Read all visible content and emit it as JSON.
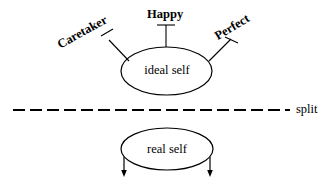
{
  "diagram": {
    "type": "concept-diagram",
    "background_color": "#ffffff",
    "stroke_color": "#000000",
    "nodes": [
      {
        "id": "ideal_self",
        "label": "ideal self",
        "shape": "ellipse"
      },
      {
        "id": "real_self",
        "label": "real self",
        "shape": "ellipse"
      }
    ],
    "attributes": [
      {
        "id": "caretaker",
        "label": "Caretaker",
        "rotation_deg": -29
      },
      {
        "id": "happy",
        "label": "Happy",
        "rotation_deg": 0
      },
      {
        "id": "perfect",
        "label": "Perfect",
        "rotation_deg": -31
      }
    ],
    "divider": {
      "id": "split",
      "label": "split",
      "style": "dashed"
    }
  }
}
